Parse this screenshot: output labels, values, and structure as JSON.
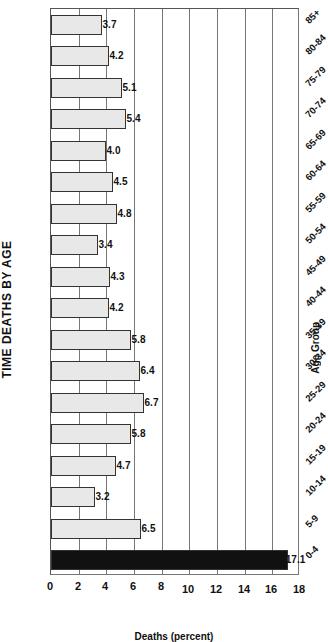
{
  "chart_data": {
    "type": "bar",
    "title": "TIME DEATHS BY AGE",
    "xlabel": "Age Group",
    "ylabel": "Deaths (percent)",
    "ylim": [
      0,
      18
    ],
    "yticks": [
      0,
      2,
      4,
      6,
      8,
      10,
      12,
      14,
      16,
      18
    ],
    "grid": true,
    "orientation_note": "figure rotated 90 degrees clockwise in image",
    "categories": [
      "0-4",
      "5-9",
      "10-14",
      "15-19",
      "20-24",
      "25-29",
      "30-34",
      "35-39",
      "40-44",
      "45-49",
      "50-54",
      "55-59",
      "60-64",
      "65-69",
      "70-74",
      "75-79",
      "80-84",
      "85+"
    ],
    "values": [
      17.1,
      6.5,
      3.2,
      4.7,
      5.8,
      6.7,
      6.4,
      5.8,
      4.2,
      4.3,
      3.4,
      4.8,
      4.5,
      4.0,
      5.4,
      5.1,
      4.2,
      3.7
    ],
    "value_labels": [
      "17.1",
      "6.5",
      "3.2",
      "4.7",
      "5.8",
      "6.7",
      "6.4",
      "5.8",
      "4.2",
      "4.3",
      "3.4",
      "4.8",
      "4.5",
      "4.0",
      "5.4",
      "5.1",
      "4.2",
      "3.7"
    ],
    "highlight": {
      "category": "0-4",
      "color": "#111111"
    },
    "bar_color": "#e0e0e0"
  }
}
